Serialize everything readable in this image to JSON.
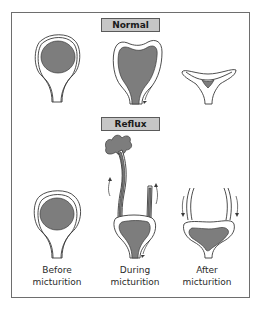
{
  "sections": {
    "normal": {
      "label": "Normal"
    },
    "reflux": {
      "label": "Reflux"
    }
  },
  "captions": {
    "before": {
      "line1": "Before",
      "line2": "micturition"
    },
    "during": {
      "line1": "During",
      "line2": "micturition"
    },
    "after": {
      "line1": "After",
      "line2": "micturition"
    }
  },
  "colors": {
    "urine_fill": "#7d7d7d",
    "label_box": "#c6c6c6",
    "outline": "#3a3a3a",
    "frame": "#6e6e6e"
  }
}
